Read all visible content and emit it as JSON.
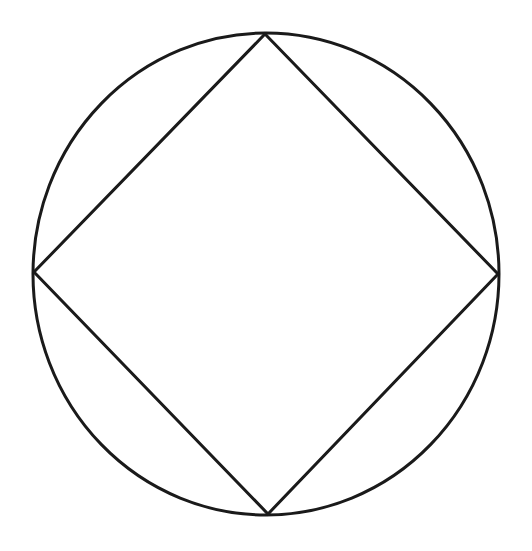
{
  "diagram": {
    "background": "#ffffff",
    "stroke_color": "#1a1a1a",
    "stroke_width": 3,
    "circle": {
      "cx": 266,
      "cy": 274,
      "rx": 233,
      "ry": 241
    },
    "square_vertices": {
      "top": [
        265,
        34
      ],
      "right": [
        498,
        274
      ],
      "bottom": [
        268,
        514
      ],
      "left": [
        34,
        272
      ]
    }
  }
}
